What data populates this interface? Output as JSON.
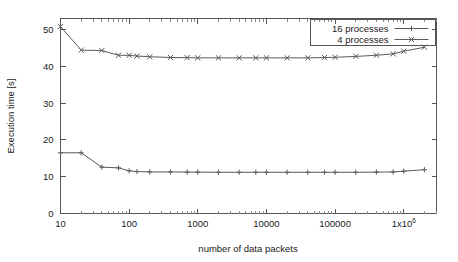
{
  "chart_data": {
    "type": "line",
    "title": "",
    "xlabel": "number of data packets",
    "ylabel": "Execution time [s]",
    "xscale": "log",
    "yscale": "linear",
    "xlim": [
      10,
      3000000
    ],
    "ylim": [
      0,
      53
    ],
    "grid": false,
    "legend_position": "top-right",
    "y_ticks": [
      "0",
      "10",
      "20",
      "30",
      "40",
      "50"
    ],
    "y_tick_values": [
      0,
      10,
      20,
      30,
      40,
      50
    ],
    "x_ticks": [
      "10",
      "100",
      "1000",
      "10000",
      "100000",
      "1x10"
    ],
    "x_tick_exponent": "6",
    "x_tick_values": [
      10,
      100,
      1000,
      10000,
      100000,
      1000000
    ],
    "series": [
      {
        "name": "16 processes",
        "marker": "plus",
        "color": "#5a5a5a",
        "x": [
          10,
          20,
          40,
          70,
          100,
          130,
          200,
          400,
          700,
          1000,
          2000,
          4000,
          7000,
          10000,
          20000,
          40000,
          70000,
          100000,
          200000,
          400000,
          700000,
          1000000,
          2000000
        ],
        "y": [
          16.5,
          16.5,
          12.6,
          12.4,
          11.6,
          11.4,
          11.3,
          11.3,
          11.25,
          11.25,
          11.2,
          11.2,
          11.2,
          11.2,
          11.2,
          11.2,
          11.2,
          11.2,
          11.2,
          11.25,
          11.3,
          11.5,
          11.9
        ]
      },
      {
        "name": "4 processes",
        "marker": "cross",
        "color": "#5a5a5a",
        "x": [
          10,
          20,
          40,
          70,
          100,
          130,
          200,
          400,
          700,
          1000,
          2000,
          4000,
          7000,
          10000,
          20000,
          40000,
          70000,
          100000,
          200000,
          400000,
          700000,
          1000000,
          2000000
        ],
        "y": [
          50.8,
          44.4,
          44.3,
          43.0,
          43.0,
          42.8,
          42.6,
          42.4,
          42.35,
          42.3,
          42.3,
          42.3,
          42.3,
          42.3,
          42.3,
          42.3,
          42.4,
          42.45,
          42.7,
          43.0,
          43.4,
          44.1,
          45.2
        ]
      }
    ],
    "legend": [
      {
        "label": "16 processes",
        "marker": "plus"
      },
      {
        "label": "4 processes",
        "marker": "cross"
      }
    ]
  },
  "colors": {
    "axis": "#555555",
    "line": "#5a5a5a",
    "text": "#1a1a1a",
    "background": "#ffffff"
  }
}
